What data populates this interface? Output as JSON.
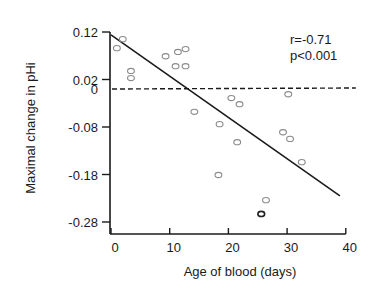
{
  "chart_data": {
    "type": "scatter",
    "title": "",
    "xlabel": "Age of blood (days)",
    "ylabel": "Maximal change in pHi",
    "xlim": [
      0,
      40
    ],
    "ylim": [
      -0.3,
      0.12
    ],
    "xticks": [
      0,
      10,
      20,
      30,
      40
    ],
    "xtick_labels": [
      "0",
      "10",
      "20",
      "30",
      "40"
    ],
    "yticks": [
      0.12,
      0.02,
      0,
      -0.08,
      -0.18,
      -0.28
    ],
    "ytick_labels": [
      "0.12",
      "0.02",
      "0",
      "-0.08",
      "-0.18",
      "-0.28"
    ],
    "grid": false,
    "annotations": [
      "r=-0.71",
      "p<0.001"
    ],
    "reference_line": {
      "y": 0,
      "style": "dashed",
      "x_range": [
        0,
        40
      ]
    },
    "regression_line": {
      "x": [
        0,
        39
      ],
      "y": [
        0.114,
        -0.225
      ]
    },
    "series": [
      {
        "name": "samples",
        "marker": "open-circle",
        "points": [
          {
            "x": 1.0,
            "y": 0.086
          },
          {
            "x": 2.0,
            "y": 0.105
          },
          {
            "x": 3.4,
            "y": 0.038
          },
          {
            "x": 3.4,
            "y": 0.023
          },
          {
            "x": 9.3,
            "y": 0.069
          },
          {
            "x": 11.0,
            "y": 0.048
          },
          {
            "x": 11.4,
            "y": 0.078
          },
          {
            "x": 12.7,
            "y": 0.084
          },
          {
            "x": 12.7,
            "y": 0.048
          },
          {
            "x": 14.2,
            "y": -0.048
          },
          {
            "x": 18.3,
            "y": -0.181
          },
          {
            "x": 18.5,
            "y": -0.074
          },
          {
            "x": 20.5,
            "y": -0.019
          },
          {
            "x": 21.5,
            "y": -0.112
          },
          {
            "x": 21.9,
            "y": -0.032
          },
          {
            "x": 25.6,
            "y": -0.263
          },
          {
            "x": 26.4,
            "y": -0.234
          },
          {
            "x": 29.3,
            "y": -0.091
          },
          {
            "x": 30.2,
            "y": -0.011
          },
          {
            "x": 30.5,
            "y": -0.105
          },
          {
            "x": 32.5,
            "y": -0.154
          }
        ]
      }
    ]
  },
  "labels": {
    "xlabel": "Age of blood (days)",
    "ylabel": "Maximal change in pHi",
    "stat_r": "r=-0.71",
    "stat_p": "p<0.001"
  },
  "colors": {
    "axis": "#1a1a1a",
    "marker": "#8a8a8a",
    "marker_dark": "#222222"
  }
}
